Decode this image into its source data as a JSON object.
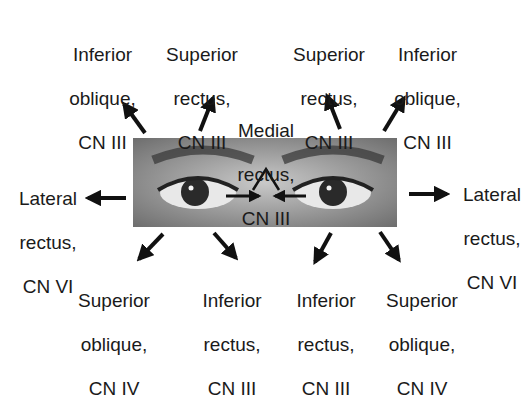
{
  "figure": {
    "photo_description": "grayscale photograph of a person's eyes"
  },
  "labels": {
    "top_left_outer": {
      "line1": "Inferior",
      "line2": "oblique,",
      "line3": "CN III"
    },
    "top_left_inner": {
      "line1": "Superior",
      "line2": "rectus,",
      "line3": "CN III"
    },
    "top_right_inner": {
      "line1": "Superior",
      "line2": "rectus,",
      "line3": "CN III"
    },
    "top_right_outer": {
      "line1": "Inferior",
      "line2": "oblique,",
      "line3": "CN III"
    },
    "center": {
      "line1": "Medial",
      "line2": "rectus,",
      "line3": "CN III"
    },
    "left": {
      "line1": "Lateral",
      "line2": "rectus,",
      "line3": "CN VI"
    },
    "right": {
      "line1": "Lateral",
      "line2": "rectus,",
      "line3": "CN VI"
    },
    "bottom_left_outer": {
      "line1": "Superior",
      "line2": "oblique,",
      "line3": "CN IV"
    },
    "bottom_left_inner": {
      "line1": "Inferior",
      "line2": "rectus,",
      "line3": "CN III"
    },
    "bottom_right_inner": {
      "line1": "Inferior",
      "line2": "rectus,",
      "line3": "CN III"
    },
    "bottom_right_outer": {
      "line1": "Superior",
      "line2": "oblique,",
      "line3": "CN IV"
    }
  },
  "arrows": [
    {
      "direction": "up-left",
      "target": "top_left_outer"
    },
    {
      "direction": "up-right",
      "target": "top_left_inner"
    },
    {
      "direction": "up-left",
      "target": "top_right_inner"
    },
    {
      "direction": "up-right",
      "target": "top_right_outer"
    },
    {
      "direction": "left",
      "target": "left"
    },
    {
      "direction": "right",
      "target": "right"
    },
    {
      "direction": "medial",
      "target": "center"
    },
    {
      "direction": "down-left",
      "target": "bottom_left_outer"
    },
    {
      "direction": "down-right",
      "target": "bottom_left_inner"
    },
    {
      "direction": "down-left",
      "target": "bottom_right_inner"
    },
    {
      "direction": "down-right",
      "target": "bottom_right_outer"
    }
  ],
  "colors": {
    "text": "#1a1a1a",
    "arrow": "#111111",
    "background": "#ffffff"
  }
}
